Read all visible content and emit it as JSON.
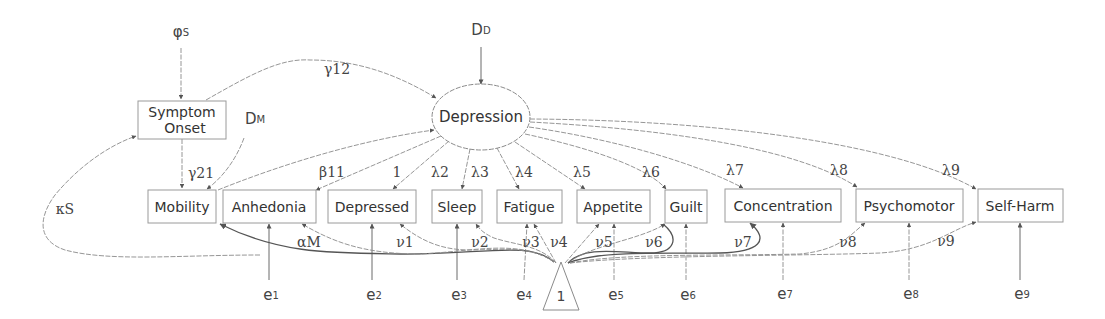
{
  "diagram": {
    "type": "structural-equation-model",
    "latent": {
      "label": "Depression",
      "cx": 481,
      "cy": 117,
      "rx": 49,
      "ry": 33
    },
    "exogenous_boxes": [
      {
        "id": "symptom_onset",
        "line1": "Symptom",
        "line2": "Onset",
        "x": 138,
        "y": 101,
        "w": 88,
        "h": 38
      },
      {
        "id": "mobility",
        "label": "Mobility",
        "x": 148,
        "y": 190,
        "w": 68,
        "h": 33
      }
    ],
    "indicators": [
      {
        "id": "anhedonia",
        "label": "Anhedonia",
        "x": 223,
        "y": 190,
        "w": 93,
        "h": 33,
        "loading": "β",
        "loading_sub": "11",
        "intercept": "ν",
        "intercept_sub": "1",
        "error": "e",
        "error_sub": "1"
      },
      {
        "id": "depressed",
        "label": "Depressed",
        "x": 328,
        "y": 190,
        "w": 88,
        "h": 33,
        "loading": "1",
        "loading_sub": "",
        "intercept": "ν",
        "intercept_sub": "1",
        "error": "e",
        "error_sub": "2"
      },
      {
        "id": "sleep",
        "label": "Sleep",
        "x": 432,
        "y": 190,
        "w": 50,
        "h": 33,
        "loading": "λ",
        "loading_sub": "2",
        "intercept": "ν",
        "intercept_sub": "2",
        "error": "e",
        "error_sub": "3"
      },
      {
        "id": "fatigue",
        "label": "Fatigue",
        "x": 497,
        "y": 190,
        "w": 65,
        "h": 33,
        "loading": "λ",
        "loading_sub": "3",
        "intercept": "ν",
        "intercept_sub": "3",
        "error": "e",
        "error_sub": "4"
      },
      {
        "id": "appetite",
        "label": "Appetite",
        "x": 577,
        "y": 190,
        "w": 73,
        "h": 33,
        "loading": "λ",
        "loading_sub": "4",
        "intercept": "ν",
        "intercept_sub": "4",
        "error": "e",
        "error_sub": "5"
      },
      {
        "id": "guilt",
        "label": "Guilt",
        "x": 665,
        "y": 190,
        "w": 42,
        "h": 33,
        "loading": "λ",
        "loading_sub": "5",
        "intercept": "ν",
        "intercept_sub": "5",
        "error": "e",
        "error_sub": "6"
      },
      {
        "id": "concentration",
        "label": "Concentration",
        "x": 725,
        "y": 189,
        "w": 116,
        "h": 33,
        "loading": "λ",
        "loading_sub": "6",
        "intercept": "ν",
        "intercept_sub": "6",
        "error": "e",
        "error_sub": "7"
      },
      {
        "id": "psychomotor",
        "label": "Psychomotor",
        "x": 856,
        "y": 189,
        "w": 107,
        "h": 33,
        "loading": "λ",
        "loading_sub": "7",
        "intercept": "ν",
        "intercept_sub": "7",
        "error": "e",
        "error_sub": "8"
      },
      {
        "id": "self_harm",
        "label": "Self-Harm",
        "x": 978,
        "y": 189,
        "w": 85,
        "h": 33,
        "loading": "λ",
        "loading_sub": "8",
        "intercept": "ν",
        "intercept_sub": "8",
        "error": "e",
        "error_sub": "9"
      }
    ],
    "labels": {
      "phi_s": {
        "main": "φ",
        "sub": "S"
      },
      "d_d": {
        "main": "D",
        "sub": "D"
      },
      "d_m": {
        "main": "D",
        "sub": "M"
      },
      "gamma12": {
        "main": "γ",
        "sub": "12"
      },
      "gamma21": {
        "main": "γ",
        "sub": "21"
      },
      "kappa_s": {
        "main": "κ",
        "sub": "S"
      },
      "alpha_m": {
        "main": "α",
        "sub": "M"
      },
      "beta11": {
        "main": "β",
        "sub": "11"
      },
      "one_loading": "1",
      "lambda2": {
        "main": "λ",
        "sub": "2"
      },
      "lambda3": {
        "main": "λ",
        "sub": "3"
      },
      "lambda4": {
        "main": "λ",
        "sub": "4"
      },
      "lambda5": {
        "main": "λ",
        "sub": "5"
      },
      "lambda6": {
        "main": "λ",
        "sub": "6"
      },
      "lambda7": {
        "main": "λ",
        "sub": "7"
      },
      "lambda8": {
        "main": "λ",
        "sub": "8"
      },
      "lambda9": {
        "main": "λ",
        "sub": "9"
      },
      "nu1": {
        "main": "ν",
        "sub": "1"
      },
      "nu2": {
        "main": "ν",
        "sub": "2"
      },
      "nu3": {
        "main": "ν",
        "sub": "3"
      },
      "nu4": {
        "main": "ν",
        "sub": "4"
      },
      "nu5": {
        "main": "ν",
        "sub": "5"
      },
      "nu6": {
        "main": "ν",
        "sub": "6"
      },
      "nu7": {
        "main": "ν",
        "sub": "7"
      },
      "nu8": {
        "main": "ν",
        "sub": "8"
      },
      "nu9": {
        "main": "ν",
        "sub": "9"
      },
      "e1": {
        "main": "e",
        "sub": "1"
      },
      "e2": {
        "main": "e",
        "sub": "2"
      },
      "e3": {
        "main": "e",
        "sub": "3"
      },
      "e4": {
        "main": "e",
        "sub": "4"
      },
      "e5": {
        "main": "e",
        "sub": "5"
      },
      "e6": {
        "main": "e",
        "sub": "6"
      },
      "e7": {
        "main": "e",
        "sub": "7"
      },
      "e8": {
        "main": "e",
        "sub": "8"
      },
      "e9": {
        "main": "e",
        "sub": "9"
      },
      "constant": "1"
    },
    "colors": {
      "line": "#8a8a8a",
      "text": "#333333",
      "background": "#ffffff"
    }
  }
}
